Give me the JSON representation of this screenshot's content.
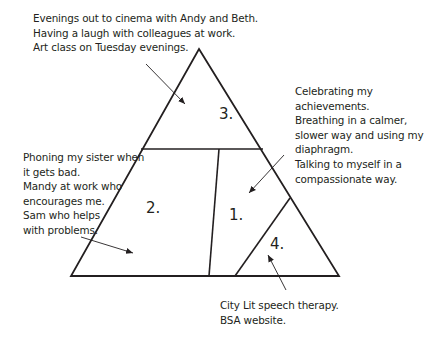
{
  "diagram": {
    "type": "triangle-sections",
    "colors": {
      "background": "#ffffff",
      "line": "#231f20",
      "text": "#231f20"
    },
    "sections": [
      {
        "id": "1",
        "label": "1.",
        "notes": [
          "Celebrating my",
          "achievements.",
          "Breathing in a calmer,",
          "slower way and using my",
          "diaphragm.",
          "Talking to myself in a",
          "compassionate way."
        ]
      },
      {
        "id": "2",
        "label": "2.",
        "notes": [
          "Phoning my sister when",
          "it gets bad.",
          "Mandy at work who",
          "encourages me.",
          "Sam who helps",
          "with problems."
        ]
      },
      {
        "id": "3",
        "label": "3.",
        "notes": [
          "Evenings out to cinema with Andy and Beth.",
          "Having a laugh with colleagues at work.",
          "Art class on Tuesday evenings."
        ]
      },
      {
        "id": "4",
        "label": "4.",
        "notes": [
          "City Lit speech therapy.",
          "BSA website."
        ]
      }
    ]
  }
}
